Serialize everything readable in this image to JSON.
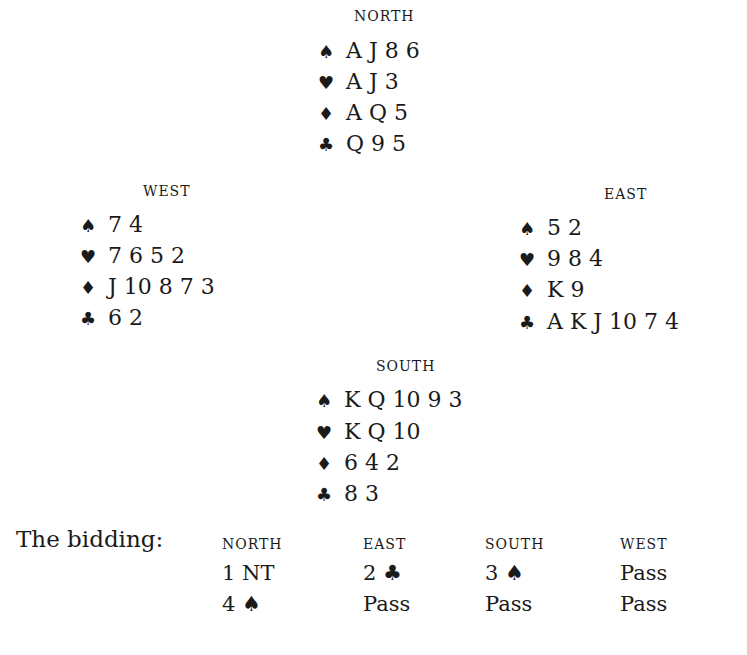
{
  "hands": {
    "north": {
      "label": "NORTH",
      "spades": "A J 8 6",
      "hearts": "A J 3",
      "diamonds": "A Q 5",
      "clubs": "Q 9 5"
    },
    "west": {
      "label": "WEST",
      "spades": "7 4",
      "hearts": "7 6 5 2",
      "diamonds": "J 10 8 7 3",
      "clubs": "6 2"
    },
    "east": {
      "label": "EAST",
      "spades": "5 2",
      "hearts": "9 8 4",
      "diamonds": "K 9",
      "clubs": "A K J 10 7 4"
    },
    "south": {
      "label": "SOUTH",
      "spades": "K Q 10 9 3",
      "hearts": "K Q 10",
      "diamonds": "6 4 2",
      "clubs": "8 3"
    }
  },
  "suit_icons": {
    "spades": "♠",
    "hearts": "♥",
    "diamonds": "♦",
    "clubs": "♣"
  },
  "bidding": {
    "label": "The bidding:",
    "headers": [
      "NORTH",
      "EAST",
      "SOUTH",
      "WEST"
    ],
    "rounds": [
      [
        "1 NT",
        "2 ♣",
        "3 ♠",
        "Pass"
      ],
      [
        "4 ♠",
        "Pass",
        "Pass",
        "Pass"
      ]
    ]
  }
}
